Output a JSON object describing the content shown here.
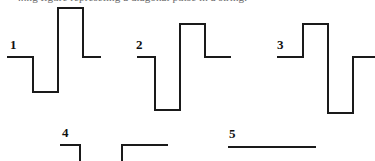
{
  "page": {
    "width": 375,
    "height": 161,
    "background_color": "#ffffff",
    "stroke_color": "#1a1a1a",
    "label_color": "#111111",
    "header_text": "...ng figure represeting a diagonal pulse in a string."
  },
  "waveforms": [
    {
      "label": "1",
      "label_x": 10,
      "label_y": 38,
      "description": "flat baseline, then negative pulse down, then tall positive pulse up, then back to baseline",
      "baseline_y": 57,
      "low_y": 92,
      "high_y": 8,
      "points": "7,57 33,57 33,92 58,92 58,8 83,8 83,57 101,57"
    },
    {
      "label": "2",
      "label_x": 136,
      "label_y": 38,
      "description": "flat baseline, then deep negative pulse down, then positive pulse up, then back to baseline",
      "baseline_y": 57,
      "low_y": 110,
      "high_y": 24,
      "points": "137,57 155,57 155,110 180,110 180,24 205,24 205,57 231,57"
    },
    {
      "label": "3",
      "label_x": 277,
      "label_y": 38,
      "description": "flat baseline, then positive pulse up, then deep negative pulse down, then back to baseline",
      "baseline_y": 57,
      "low_y": 113,
      "high_y": 24,
      "points": "277,57 303,57 303,24 328,24 328,113 353,113 353,57 375,57"
    },
    {
      "label": "4",
      "label_x": 62,
      "label_y": 126,
      "description": "short flat segment dropping off the bottom edge, then a second flat segment rising from the bottom edge",
      "baseline_y": 145,
      "points_a": "60,145 80,145 80,161",
      "points_b": "122,161 122,145 168,145"
    },
    {
      "label": "5",
      "label_x": 229,
      "label_y": 127,
      "description": "a single flat horizontal line with no pulse",
      "baseline_y": 147,
      "points": "228,147 316,147"
    }
  ]
}
